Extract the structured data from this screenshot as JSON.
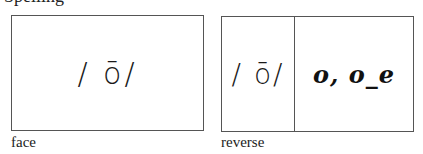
{
  "header": {
    "cut_text": "Spelling"
  },
  "face_card": {
    "phoneme": "/ ō/",
    "caption": "face"
  },
  "reverse_card": {
    "phoneme": "/ ō/",
    "spellings": "o, o_e",
    "caption": "reverse"
  }
}
